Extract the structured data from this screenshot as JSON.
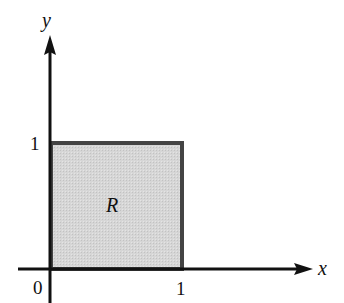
{
  "diagram": {
    "type": "region-in-plane",
    "axes": {
      "x_label": "x",
      "y_label": "y",
      "origin_label": "0",
      "x_tick_label": "1",
      "y_tick_label": "1"
    },
    "region": {
      "label": "R",
      "shape": "unit square",
      "corners": [
        [
          0,
          0
        ],
        [
          1,
          0
        ],
        [
          1,
          1
        ],
        [
          0,
          1
        ]
      ],
      "fill_color": "#d4d4d4",
      "border_color": "#444444"
    },
    "axis_color": "#111111"
  }
}
